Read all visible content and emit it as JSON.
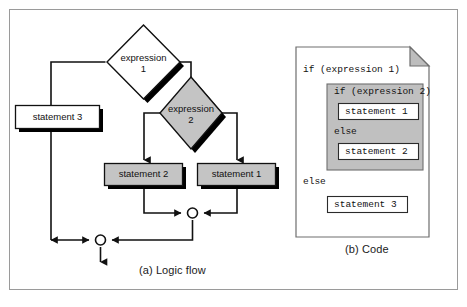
{
  "figure": {
    "caption_a": "(a) Logic flow",
    "caption_b": "(b) Code",
    "border_color": "#9a9a9a",
    "background": "#ffffff"
  },
  "colors": {
    "shape_gray": "#c4c4c4",
    "shape_white": "#ffffff",
    "shadow": "#000000",
    "outline": "#1a1a1a",
    "code_block_gray": "#c0c0c0",
    "page_border": "#6e6e6e",
    "fold_gray": "#bdbdbd"
  },
  "flowchart": {
    "type": "logic-flow",
    "nodes": [
      {
        "id": "expression-1",
        "kind": "decision",
        "label_line1": "expression",
        "label_line2": "1",
        "fill": "#ffffff"
      },
      {
        "id": "expression-2",
        "kind": "decision",
        "label_line1": "expression",
        "label_line2": "2",
        "fill": "#c4c4c4"
      },
      {
        "id": "statement-3",
        "kind": "process",
        "label": "statement 3",
        "fill": "#ffffff"
      },
      {
        "id": "statement-2",
        "kind": "process",
        "label": "statement 2",
        "fill": "#c4c4c4"
      },
      {
        "id": "statement-1",
        "kind": "process",
        "label": "statement 1",
        "fill": "#c4c4c4"
      },
      {
        "id": "merge-inner",
        "kind": "junction"
      },
      {
        "id": "merge-outer",
        "kind": "junction"
      },
      {
        "id": "exit",
        "kind": "terminator"
      }
    ],
    "edges": [
      {
        "from": "expression-1",
        "to": "statement-3",
        "branch": "false-left"
      },
      {
        "from": "expression-1",
        "to": "expression-2",
        "branch": "true-right"
      },
      {
        "from": "expression-2",
        "to": "statement-2",
        "branch": "false-left"
      },
      {
        "from": "expression-2",
        "to": "statement-1",
        "branch": "true-right"
      },
      {
        "from": "statement-2",
        "to": "merge-inner"
      },
      {
        "from": "statement-1",
        "to": "merge-inner"
      },
      {
        "from": "merge-inner",
        "to": "merge-outer"
      },
      {
        "from": "statement-3",
        "to": "merge-outer"
      },
      {
        "from": "merge-outer",
        "to": "exit"
      }
    ]
  },
  "code_panel": {
    "title": "code-page",
    "lines": [
      {
        "id": "line-if-1",
        "text": "if (expression 1)",
        "indent": 0,
        "style": "plain"
      },
      {
        "id": "line-if-2",
        "text": "if (expression 2)",
        "indent": 1,
        "style": "shaded"
      },
      {
        "id": "line-stmt-1",
        "text": "statement 1",
        "indent": 2,
        "style": "boxed"
      },
      {
        "id": "line-else-inner",
        "text": "else",
        "indent": 1,
        "style": "shaded"
      },
      {
        "id": "line-stmt-2",
        "text": "statement 2",
        "indent": 2,
        "style": "boxed"
      },
      {
        "id": "line-else-outer",
        "text": "else",
        "indent": 0,
        "style": "plain"
      },
      {
        "id": "line-stmt-3",
        "text": "statement 3",
        "indent": 1,
        "style": "boxed"
      }
    ]
  }
}
